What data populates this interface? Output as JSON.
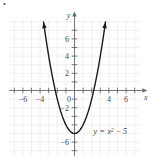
{
  "figure": {
    "corner_mark": "•",
    "background_color": "#ffffff",
    "grid_color": "#e8e6e4",
    "axis_color": "#6b6b6b",
    "curve_color": "#1a1a1a"
  },
  "axes": {
    "x_axis_label": "x",
    "y_axis_label": "y",
    "origin_label": "0"
  },
  "equation": {
    "lhs": "y",
    "equals": "=",
    "variable": "x",
    "exponent": "2",
    "minus": "−",
    "constant": "5",
    "full_text": "y = x² − 5"
  },
  "chart_data": {
    "type": "line",
    "title": "",
    "subtitle": "",
    "xlabel": "x",
    "ylabel": "y",
    "xlim": [
      -7.6,
      7.6
    ],
    "ylim": [
      -7.6,
      8.2
    ],
    "grid": true,
    "grid_step": 1,
    "legend": "none",
    "annotations": [
      {
        "text": "y = x² − 5",
        "x": 2.2,
        "y": -5.1
      }
    ],
    "x_ticks": [
      -6,
      -4,
      -2,
      0,
      2,
      4,
      6
    ],
    "x_tick_labels": [
      "-6",
      "-4",
      "",
      "0",
      "",
      "4",
      "6"
    ],
    "x_minor_ticks": [
      -7,
      -5,
      -3,
      -1,
      1,
      3,
      5,
      7
    ],
    "y_ticks": [
      -6,
      -4,
      -2,
      0,
      2,
      4,
      6
    ],
    "y_tick_labels": [
      "-6",
      "",
      "-2",
      "0",
      "2",
      "4",
      "6"
    ],
    "y_minor_ticks": [
      -7,
      -5,
      -3,
      -1,
      1,
      3,
      5,
      7
    ],
    "series": [
      {
        "name": "y = x² − 5",
        "equation": "y = x^2 - 5",
        "color": "#1a1a1a",
        "vertex": [
          0,
          -5
        ],
        "roots": [
          -2.236,
          2.236
        ],
        "y_intercept": -5,
        "arrowheads": [
          "start",
          "end"
        ],
        "x": [
          -3.6,
          -3.4,
          -3.2,
          -3.0,
          -2.8,
          -2.6,
          -2.4,
          -2.2,
          -2.0,
          -1.8,
          -1.6,
          -1.4,
          -1.2,
          -1.0,
          -0.8,
          -0.6,
          -0.4,
          -0.2,
          0.0,
          0.2,
          0.4,
          0.6,
          0.8,
          1.0,
          1.2,
          1.4,
          1.6,
          1.8,
          2.0,
          2.2,
          2.4,
          2.6,
          2.8,
          3.0,
          3.2,
          3.4,
          3.6
        ],
        "values": [
          7.96,
          6.56,
          5.24,
          4.0,
          2.84,
          1.76,
          0.76,
          -0.16,
          -1.0,
          -1.76,
          -2.44,
          -3.04,
          -3.56,
          -4.0,
          -4.36,
          -4.64,
          -4.84,
          -4.96,
          -5.0,
          -4.96,
          -4.84,
          -4.64,
          -4.36,
          -4.0,
          -3.56,
          -3.04,
          -2.44,
          -1.76,
          -1.0,
          -0.16,
          0.76,
          1.76,
          2.84,
          4.0,
          5.24,
          6.56,
          7.96
        ]
      }
    ]
  }
}
